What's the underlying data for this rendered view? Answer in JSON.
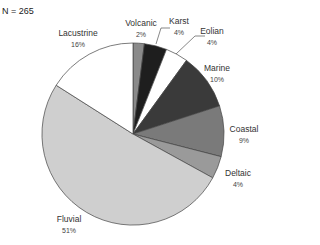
{
  "chart_data": {
    "type": "pie",
    "title": "",
    "annotation": "N = 265",
    "categories": [
      "Volcanic",
      "Karst",
      "Eolian",
      "Marine",
      "Coastal",
      "Deltaic",
      "Fluvial",
      "Lacustrine"
    ],
    "values": [
      2,
      4,
      4,
      10,
      9,
      4,
      51,
      16
    ],
    "unit": "%",
    "colors": [
      "#8a8a8a",
      "#1e1e1e",
      "#ffffff",
      "#3a3a3a",
      "#7a7a7a",
      "#9a9a9a",
      "#cfcfcf",
      "#ffffff"
    ],
    "start_angle_deg": 0,
    "direction": "clockwise",
    "labels": [
      {
        "name": "Volcanic",
        "pct": "2%"
      },
      {
        "name": "Karst",
        "pct": "4%"
      },
      {
        "name": "Eolian",
        "pct": "4%"
      },
      {
        "name": "Marine",
        "pct": "10%"
      },
      {
        "name": "Coastal",
        "pct": "9%"
      },
      {
        "name": "Deltaic",
        "pct": "4%"
      },
      {
        "name": "Fluvial",
        "pct": "51%"
      },
      {
        "name": "Lacustrine",
        "pct": "16%"
      }
    ]
  }
}
